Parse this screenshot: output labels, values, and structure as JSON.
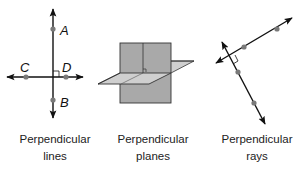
{
  "figures": [
    {
      "id": "perpendicular-lines",
      "caption_line1": "Perpendicular",
      "caption_line2": "lines",
      "points": [
        {
          "label": "A"
        },
        {
          "label": "B"
        },
        {
          "label": "C"
        },
        {
          "label": "D"
        }
      ]
    },
    {
      "id": "perpendicular-planes",
      "caption_line1": "Perpendicular",
      "caption_line2": "planes"
    },
    {
      "id": "perpendicular-rays",
      "caption_line1": "Perpendicular",
      "caption_line2": "rays"
    }
  ],
  "colors": {
    "line": "#111111",
    "point": "#7a7a7a",
    "plane_vertical": "#a9a9a9",
    "plane_horizontal": "#cfcfcf",
    "plane_edge": "#333333"
  }
}
